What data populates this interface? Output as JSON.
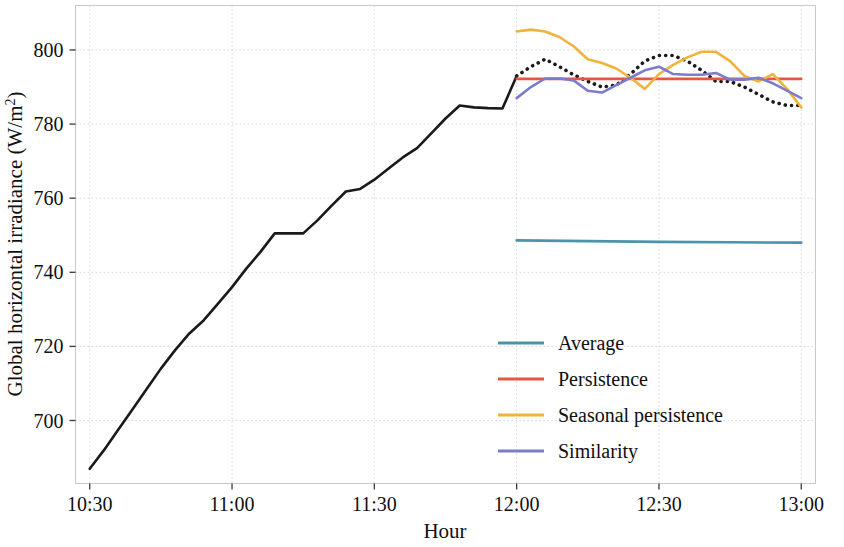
{
  "chart_data": {
    "type": "line",
    "title": "",
    "xlabel": "Hour",
    "ylabel": "Global horizontal irradiance (W/m²)",
    "xtick_labels": [
      "10:30",
      "11:00",
      "11:30",
      "12:00",
      "12:30",
      "13:00"
    ],
    "xtick_values": [
      10.5,
      11.0,
      11.5,
      12.0,
      12.5,
      13.0
    ],
    "ytick_labels": [
      "700",
      "720",
      "740",
      "760",
      "780",
      "800"
    ],
    "ytick_values": [
      700,
      720,
      740,
      760,
      780,
      800
    ],
    "xlim": [
      10.45,
      13.05
    ],
    "ylim": [
      683,
      812
    ],
    "grid": true,
    "legend_position": "center-right",
    "legend_entries": [
      {
        "label": "Average",
        "color": "#4a93ab"
      },
      {
        "label": "Persistence",
        "color": "#e8563f"
      },
      {
        "label": "Seasonal persistence",
        "color": "#f0b33c"
      },
      {
        "label": "Similarity",
        "color": "#7b7ccb"
      }
    ],
    "series": [
      {
        "name": "Observed",
        "color": "#1a1a1a",
        "style": "solid",
        "in_legend": false,
        "x": [
          10.5,
          10.55,
          10.6,
          10.65,
          10.7,
          10.75,
          10.8,
          10.85,
          10.9,
          10.95,
          11.0,
          11.05,
          11.1,
          11.15,
          11.2,
          11.25,
          11.3,
          11.35,
          11.4,
          11.45,
          11.5,
          11.55,
          11.6,
          11.65,
          11.7,
          11.75,
          11.8,
          11.85,
          11.9,
          11.95,
          12.0
        ],
        "y": [
          687.0,
          692.0,
          697.5,
          703.0,
          708.5,
          714.0,
          719.0,
          723.5,
          727.0,
          731.5,
          736.0,
          741.0,
          745.5,
          750.5,
          750.5,
          750.5,
          754.0,
          758.0,
          761.8,
          762.5,
          765.0,
          768.0,
          771.0,
          773.5,
          777.5,
          781.5,
          785.0,
          784.5,
          784.3,
          784.2,
          793.0
        ]
      },
      {
        "name": "Observed (forecast horizon)",
        "color": "#1a1a1a",
        "style": "dotted",
        "in_legend": false,
        "x": [
          12.0,
          12.05,
          12.1,
          12.15,
          12.2,
          12.25,
          12.3,
          12.35,
          12.4,
          12.45,
          12.5,
          12.55,
          12.6,
          12.65,
          12.7,
          12.75,
          12.8,
          12.85,
          12.9,
          12.95,
          13.0
        ],
        "y": [
          793.0,
          795.5,
          797.5,
          795.5,
          793.3,
          791.5,
          790.0,
          790.5,
          793.5,
          797.0,
          798.5,
          798.5,
          797.0,
          794.5,
          791.5,
          791.5,
          790.0,
          788.0,
          786.0,
          785.0,
          785.0
        ]
      },
      {
        "name": "Average",
        "color": "#4a93ab",
        "style": "solid",
        "in_legend": true,
        "x": [
          12.0,
          12.25,
          12.5,
          12.75,
          13.0
        ],
        "y": [
          748.6,
          748.4,
          748.2,
          748.1,
          748.0
        ]
      },
      {
        "name": "Persistence",
        "color": "#e8563f",
        "style": "solid",
        "in_legend": true,
        "x": [
          12.0,
          12.25,
          12.5,
          12.75,
          13.0
        ],
        "y": [
          792.2,
          792.2,
          792.2,
          792.2,
          792.2
        ]
      },
      {
        "name": "Seasonal persistence",
        "color": "#f0b33c",
        "style": "solid",
        "in_legend": true,
        "x": [
          12.0,
          12.05,
          12.1,
          12.15,
          12.2,
          12.25,
          12.3,
          12.35,
          12.4,
          12.45,
          12.5,
          12.55,
          12.6,
          12.65,
          12.7,
          12.75,
          12.8,
          12.85,
          12.9,
          12.95,
          13.0
        ],
        "y": [
          805.0,
          805.5,
          805.0,
          803.5,
          801.0,
          797.5,
          796.5,
          795.0,
          792.5,
          789.5,
          793.5,
          796.0,
          798.0,
          799.5,
          799.5,
          797.0,
          793.0,
          791.5,
          793.5,
          789.5,
          784.5
        ]
      },
      {
        "name": "Similarity",
        "color": "#7b7ccb",
        "style": "solid",
        "in_legend": true,
        "x": [
          12.0,
          12.05,
          12.1,
          12.15,
          12.2,
          12.25,
          12.3,
          12.35,
          12.4,
          12.45,
          12.5,
          12.55,
          12.6,
          12.65,
          12.7,
          12.75,
          12.8,
          12.85,
          12.9,
          12.95,
          13.0
        ],
        "y": [
          787.0,
          790.0,
          792.3,
          792.3,
          791.8,
          789.0,
          788.5,
          790.5,
          792.5,
          794.5,
          795.5,
          793.5,
          793.3,
          793.3,
          793.8,
          792.0,
          792.0,
          792.5,
          791.0,
          789.0,
          787.0
        ]
      }
    ]
  }
}
